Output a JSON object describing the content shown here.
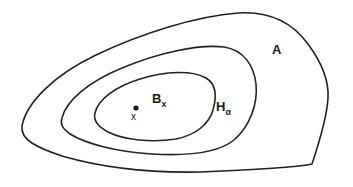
{
  "figure": {
    "type": "set-diagram",
    "background_color": "#ffffff",
    "stroke_color": "#222222",
    "labels": {
      "outer_region": "A",
      "middle_region_base": "H",
      "middle_region_sub": "α",
      "inner_region_base": "B",
      "inner_region_sub": "x",
      "point": "x"
    },
    "point_marker": {
      "name": "x",
      "cx": 136,
      "cy": 108,
      "r": 2.6,
      "color": "#1a1a1a"
    },
    "curves": {
      "outer_A": "M 22 126 C 26 104 52 76 96 55 C 140 34 196 16 238 13 C 268 11 292 22 308 44 C 322 63 329 82 328 98 C 327 116 320 140 312 164 C 300 167 250 170 200 172 C 150 173 100 167 62 156 C 38 148 20 140 22 126 Z",
      "middle_H": "M 62 118 C 66 101 88 82 122 68 C 158 53 198 44 224 47 C 244 50 254 66 256 84 C 258 104 250 126 234 140 C 218 153 186 156 152 154 C 118 152 86 144 70 134 C 62 128 60 124 62 118 Z",
      "inner_B": "M 95 113 C 98 100 114 87 140 79 C 166 71 192 70 206 78 C 216 84 217 96 213 110 C 209 124 196 135 176 139 C 152 143 124 140 108 132 C 97 126 93 120 95 113 Z"
    }
  }
}
